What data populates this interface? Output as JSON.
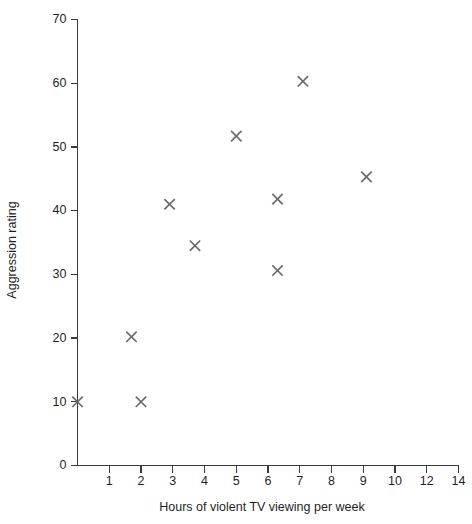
{
  "chart_data": {
    "type": "scatter",
    "title": "",
    "xlabel": "Hours of violent TV viewing per week",
    "ylabel": "Aggression rating",
    "marker": "x",
    "marker_color": "#6b6b6b",
    "axis_color": "#3a3a3a",
    "grid": false,
    "legend": null,
    "xlim": [
      0,
      14
    ],
    "ylim": [
      0,
      70
    ],
    "xticks": [
      1,
      2,
      3,
      4,
      5,
      6,
      7,
      8,
      9,
      10,
      12,
      14
    ],
    "xtick_labels": [
      "1",
      "2",
      "3",
      "4",
      "5",
      "6",
      "7",
      "8",
      "9",
      "10",
      "12",
      "14"
    ],
    "xtick_note": "tick labels are evenly spaced although values 10, 12, 14 step by 2",
    "yticks": [
      0,
      10,
      20,
      30,
      40,
      50,
      60,
      70
    ],
    "ytick_labels": [
      "0",
      "10",
      "20",
      "30",
      "40",
      "50",
      "60",
      "70"
    ],
    "points": [
      {
        "x": 0.0,
        "y": 10.0
      },
      {
        "x": 1.7,
        "y": 20.2
      },
      {
        "x": 2.0,
        "y": 10.0
      },
      {
        "x": 2.9,
        "y": 41.0
      },
      {
        "x": 3.7,
        "y": 34.5
      },
      {
        "x": 5.0,
        "y": 51.7
      },
      {
        "x": 6.3,
        "y": 41.8
      },
      {
        "x": 6.3,
        "y": 30.6
      },
      {
        "x": 7.1,
        "y": 60.3
      },
      {
        "x": 9.1,
        "y": 45.3
      }
    ],
    "x": [
      0.0,
      1.7,
      2.0,
      2.9,
      3.7,
      5.0,
      6.3,
      6.3,
      7.1,
      9.1
    ],
    "values": [
      10.0,
      20.2,
      10.0,
      41.0,
      34.5,
      51.7,
      41.8,
      30.6,
      60.3,
      45.3
    ]
  }
}
